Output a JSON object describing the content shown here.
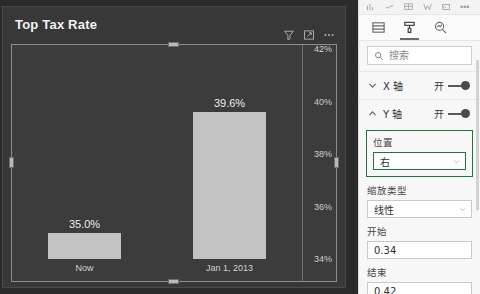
{
  "visual": {
    "title": "Top Tax Rate",
    "header_icons": [
      {
        "name": "filter-icon",
        "label": "筛选器"
      },
      {
        "name": "focus-mode-icon",
        "label": "聚焦模式"
      },
      {
        "name": "more-options-icon",
        "label": "更多选项"
      }
    ]
  },
  "chart_data": {
    "type": "bar",
    "title": "Top Tax Rate",
    "categories": [
      "Now",
      "Jan 1, 2013"
    ],
    "values": [
      35.0,
      39.6
    ],
    "data_labels": [
      "35.0%",
      "39.6%"
    ],
    "xlabel": "",
    "ylabel": "",
    "ylim": [
      34,
      42
    ],
    "yticks": [
      42,
      40,
      38,
      36,
      34
    ],
    "ytick_labels": [
      "42%",
      "40%",
      "38%",
      "36%",
      "34%"
    ],
    "y_axis_position": "right",
    "grid": false,
    "legend": "none",
    "bar_color": "#c2c2c2",
    "plot_background": "#3c3c3c",
    "card_background": "#383838",
    "text_color": "#ededed"
  },
  "panel": {
    "top_strip_icons": [
      "insert-icon",
      "line-icon",
      "table-icon",
      "shape-icon",
      "image-icon",
      "overflow-dots-icon"
    ],
    "tabs": [
      {
        "name": "tab-fields",
        "icon": "fields-icon",
        "active": false
      },
      {
        "name": "tab-format",
        "icon": "paint-roller-icon",
        "active": true
      },
      {
        "name": "tab-analytics",
        "icon": "magnifier-icon",
        "active": false
      }
    ],
    "search": {
      "placeholder": "搜索",
      "value": ""
    },
    "sections": [
      {
        "name": "x-axis",
        "label": "X 轴",
        "expanded": false,
        "toggle_label": "开",
        "toggle_on": true
      },
      {
        "name": "y-axis",
        "label": "Y 轴",
        "expanded": true,
        "toggle_label": "开",
        "toggle_on": true
      }
    ],
    "y_axis_fields": {
      "position": {
        "label": "位置",
        "value": "右",
        "focused": true
      },
      "scale_type": {
        "label": "缩放类型",
        "value": "线性",
        "focused": false
      },
      "start": {
        "label": "开始",
        "value": "0.34"
      },
      "end": {
        "label": "结束",
        "value": "0.42"
      }
    }
  },
  "colors": {
    "accent_focus": "#1a7a3c",
    "panel_bg": "#f7f7f7",
    "canvas_bg": "#2b2b2b"
  }
}
